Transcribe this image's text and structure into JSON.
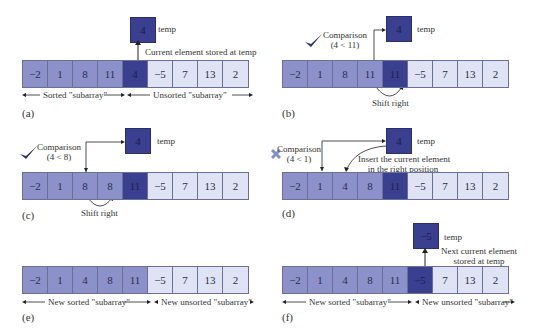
{
  "colors": {
    "sorted": "#8c92c9",
    "current": "#3a3f8f",
    "unsorted": "#dfe3f3",
    "border": "#6a6f98",
    "check": "#2b3170",
    "cross": "#7f8fc8"
  },
  "temp_label": "temp",
  "panels": [
    {
      "caption": "(a)",
      "values": [
        "−2",
        "1",
        "8",
        "11",
        "4",
        "−5",
        "7",
        "13",
        "2"
      ],
      "states": [
        "sorted",
        "sorted",
        "sorted",
        "sorted",
        "current",
        "unsorted",
        "unsorted",
        "unsorted",
        "unsorted"
      ],
      "temp_value": "4",
      "note": "Current element stored at temp",
      "range_left": "Sorted \"subarray\"",
      "range_right": "Unsorted \"subarray\""
    },
    {
      "caption": "(b)",
      "values": [
        "−2",
        "1",
        "8",
        "11",
        "11",
        "−5",
        "7",
        "13",
        "2"
      ],
      "states": [
        "sorted",
        "sorted",
        "sorted",
        "sorted",
        "current",
        "unsorted",
        "unsorted",
        "unsorted",
        "unsorted"
      ],
      "temp_value": "4",
      "comparison_title": "Comparison",
      "comparison_expr": "(4 < 11)",
      "comparison_result": "check",
      "shift_label": "Shift right"
    },
    {
      "caption": "(c)",
      "values": [
        "−2",
        "1",
        "8",
        "8",
        "11",
        "−5",
        "7",
        "13",
        "2"
      ],
      "states": [
        "sorted",
        "sorted",
        "sorted",
        "sorted",
        "current",
        "unsorted",
        "unsorted",
        "unsorted",
        "unsorted"
      ],
      "temp_value": "4",
      "comparison_title": "Comparison",
      "comparison_expr": "(4 < 8)",
      "comparison_result": "check",
      "shift_label": "Shift right"
    },
    {
      "caption": "(d)",
      "values": [
        "−2",
        "1",
        "4",
        "8",
        "11",
        "−5",
        "7",
        "13",
        "2"
      ],
      "states": [
        "sorted",
        "sorted",
        "sorted",
        "sorted",
        "current",
        "unsorted",
        "unsorted",
        "unsorted",
        "unsorted"
      ],
      "temp_value": "4",
      "comparison_title": "Comparison",
      "comparison_expr": "(4 < 1)",
      "comparison_result": "cross",
      "insert_note_line1": "Insert the current element",
      "insert_note_line2": "in the right position"
    },
    {
      "caption": "(e)",
      "values": [
        "−2",
        "1",
        "4",
        "8",
        "11",
        "−5",
        "7",
        "13",
        "2"
      ],
      "states": [
        "sorted",
        "sorted",
        "sorted",
        "sorted",
        "sorted",
        "unsorted",
        "unsorted",
        "unsorted",
        "unsorted"
      ],
      "range_left": "New sorted \"subarray\"",
      "range_right": "New unsorted \"subarray\""
    },
    {
      "caption": "(f)",
      "values": [
        "−2",
        "1",
        "4",
        "8",
        "11",
        "−5",
        "7",
        "13",
        "2"
      ],
      "states": [
        "sorted",
        "sorted",
        "sorted",
        "sorted",
        "sorted",
        "current",
        "unsorted",
        "unsorted",
        "unsorted"
      ],
      "temp_value": "−5",
      "note_line1": "Next current element",
      "note_line2": "stored at temp",
      "range_left": "New sorted \"subarray\"",
      "range_right": "New unsorted \"subarray\""
    }
  ]
}
